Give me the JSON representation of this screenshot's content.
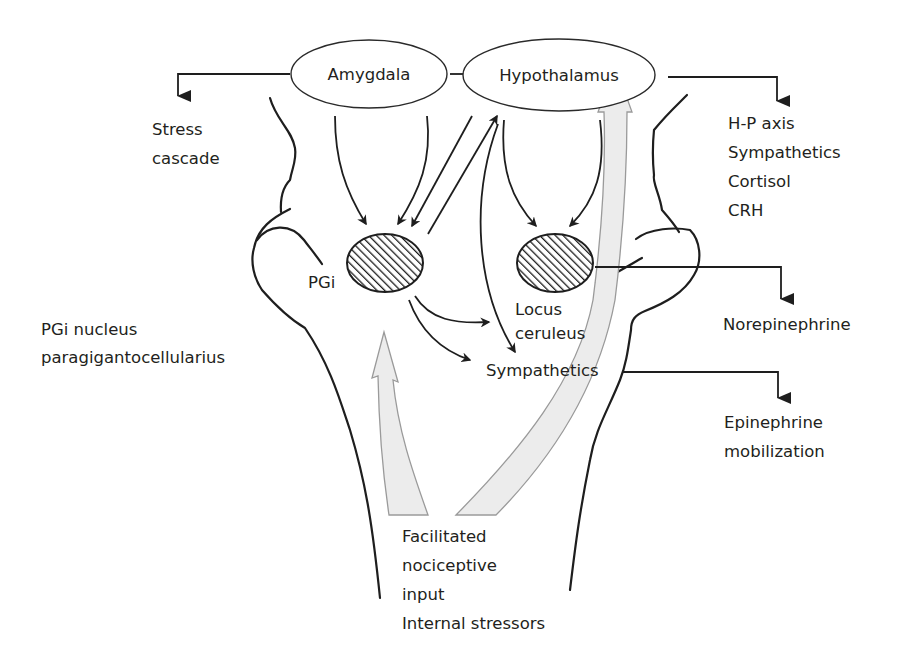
{
  "nodes": {
    "amygdala": "Amygdala",
    "hypothalamus": "Hypothalamus",
    "pgi": "PGi",
    "locus_ceruleus": [
      "Locus",
      "ceruleus"
    ],
    "sympathetics": "Sympathetics"
  },
  "outputs": {
    "stress_cascade": [
      "Stress",
      "cascade"
    ],
    "hypothalamic_outputs": [
      "H-P axis",
      "Sympathetics",
      "Cortisol",
      "CRH"
    ],
    "norepinephrine": "Norepinephrine",
    "epinephrine": [
      "Epinephrine",
      "mobilization"
    ]
  },
  "legend": {
    "pgi_definition": [
      "PGi nucleus",
      "paragigantocellularius"
    ]
  },
  "inputs": {
    "lines": [
      "Facilitated",
      "nociceptive",
      "input",
      "Internal stressors"
    ]
  },
  "colors": {
    "ink": "#1e1e1e",
    "input_arrow_fill": "#ececec",
    "input_arrow_stroke": "#9a9a9a",
    "background": "#ffffff"
  }
}
